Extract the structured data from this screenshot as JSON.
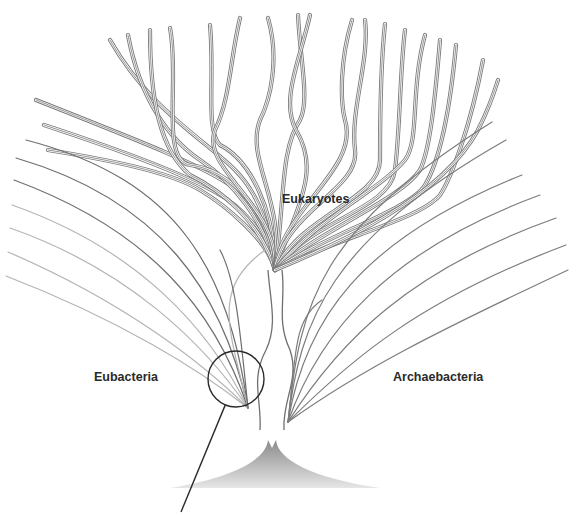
{
  "diagram": {
    "type": "phylogenetic-tree",
    "labels": {
      "eukaryotes": "Eukaryotes",
      "eubacteria": "Eubacteria",
      "archaebacteria": "Archaebacteria"
    },
    "colors": {
      "background": "#ffffff",
      "eukaryote_stroke": "#7a7a7a",
      "eubacteria_dark": "#6e6e6e",
      "eubacteria_light": "#b4b4b4",
      "archaebacteria_stroke": "#7c7c7c",
      "root_fill": "#9a9a9a",
      "magnifier_stroke": "#2a2a2a",
      "label_text": "#2a2a2a"
    },
    "root": {
      "apex_x": 272,
      "apex_y": 440,
      "base_y": 488,
      "base_left": 170,
      "base_right": 380
    },
    "magnifier": {
      "cx": 236,
      "cy": 379,
      "r": 28,
      "pointer_end_x": 181,
      "pointer_end_y": 512
    },
    "eubacteria_branches": [
      {
        "d": "M248 408 C 200 370, 120 320, 6 276",
        "tone": "light"
      },
      {
        "d": "M248 408 C 200 360, 120 300, 8 252",
        "tone": "light"
      },
      {
        "d": "M248 408 C 205 345, 130 270, 10 228",
        "tone": "light"
      },
      {
        "d": "M248 408 C 210 330, 140 250, 12 205",
        "tone": "light"
      },
      {
        "d": "M248 408 C 215 310, 150 230, 14 180",
        "tone": "dark"
      },
      {
        "d": "M248 408 C 222 290, 160 200, 16 158",
        "tone": "dark"
      },
      {
        "d": "M248 408 C 228 270, 180 180, 26 140",
        "tone": "dark"
      },
      {
        "d": "M248 408 C 230 330, 210 290, 265 250",
        "tone": "light"
      },
      {
        "d": "M248 408 C 240 330, 236 280, 220 250",
        "tone": "dark"
      }
    ],
    "archaebacteria_branches": [
      {
        "d": "M288 422 C 360 370, 440 330, 568 270",
        "tone": "dark"
      },
      {
        "d": "M288 422 C 350 360, 420 300, 566 245",
        "tone": "dark"
      },
      {
        "d": "M288 422 C 340 340, 410 270, 556 218",
        "tone": "dark"
      },
      {
        "d": "M288 422 C 320 330, 390 250, 540 195",
        "tone": "dark"
      },
      {
        "d": "M288 422 C 305 320, 360 240, 522 175",
        "tone": "dark"
      },
      {
        "d": "M288 422 C 300 320, 330 240, 506 140",
        "tone": "dark"
      },
      {
        "d": "M288 422 C 300 300, 320 230, 492 122",
        "tone": "dark"
      },
      {
        "d": "M288 422 C 296 360, 292 320, 322 300",
        "tone": "dark"
      }
    ],
    "stems": [
      {
        "d": "M260 430 C 262 400, 250 380, 266 350 C 278 325, 270 300, 268 270"
      },
      {
        "d": "M284 430 C 282 400, 300 380, 290 350 C 276 320, 286 300, 282 270"
      }
    ],
    "eukaryote_branches": [
      {
        "d": "M275 270 C 272 230, 250 200, 230 185 C 200 165, 150 145, 36 100"
      },
      {
        "d": "M275 270 C 270 235, 240 205, 215 192 C 180 172, 120 150, 44 125"
      },
      {
        "d": "M275 270 C 268 240, 225 205, 200 190 C 170 172, 110 160, 48 150"
      },
      {
        "d": "M275 270 C 270 220, 255 190, 235 170 C 205 140, 150 110, 110 40"
      },
      {
        "d": "M275 270 C 266 220, 230 180, 200 160 C 170 140, 140 100, 128 35"
      },
      {
        "d": "M275 270 C 260 220, 220 190, 190 175 C 160 150, 150 100, 150 30"
      },
      {
        "d": "M275 270 C 270 210, 230 170, 190 165 C 160 160, 180 80, 170 28"
      },
      {
        "d": "M275 270 C 275 210, 250 160, 220 145 C 205 130, 215 80, 210 25"
      },
      {
        "d": "M275 270 C 280 205, 200 170, 215 130 C 230 100, 230 60, 240 18"
      },
      {
        "d": "M275 270 C 285 200, 245 160, 260 120 C 270 100, 280 60, 268 18"
      },
      {
        "d": "M275 270 C 285 200, 280 150, 300 120 C 310 100, 300 60, 298 15"
      },
      {
        "d": "M275 270 C 300 200, 320 170, 296 130 C 280 100, 300 60, 310 15"
      },
      {
        "d": "M275 270 C 280 210, 360 170, 345 120 C 340 100, 340 60, 352 20"
      },
      {
        "d": "M275 270 C 285 210, 360 190, 355 150 C 350 110, 370 60, 365 20"
      },
      {
        "d": "M275 270 C 300 215, 380 200, 380 160 C 380 130, 380 70, 385 24"
      },
      {
        "d": "M275 270 C 310 220, 390 210, 395 170 C 400 130, 400 70, 405 30"
      },
      {
        "d": "M275 270 C 315 220, 380 190, 405 160 C 420 140, 410 90, 425 35"
      },
      {
        "d": "M275 270 C 320 230, 400 200, 420 170 C 430 150, 435 100, 440 40"
      },
      {
        "d": "M275 270 C 325 235, 410 210, 425 185 C 440 160, 450 110, 456 45"
      },
      {
        "d": "M275 270 C 330 240, 420 220, 440 195 C 450 180, 470 130, 483 60"
      },
      {
        "d": "M275 270 C 335 245, 440 200, 478 130 C 488 110, 495 90, 498 80"
      }
    ]
  }
}
